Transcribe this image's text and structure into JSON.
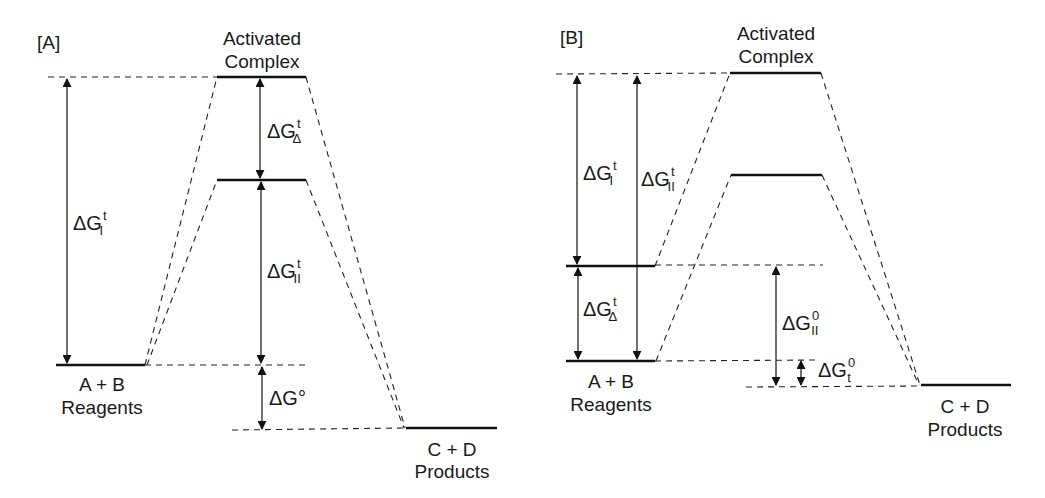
{
  "panels": [
    {
      "id": "A",
      "label": "[A]",
      "activated_complex": [
        "Activated",
        "Complex"
      ],
      "reagents": [
        "A + B",
        "Reagents"
      ],
      "products": [
        "C + D",
        "Products"
      ],
      "quantities": [
        {
          "base": "ΔG",
          "sup": "t",
          "sub": "I"
        },
        {
          "base": "ΔG",
          "sup": "t",
          "sub": "Δ"
        },
        {
          "base": "ΔG",
          "sup": "t",
          "sub": "II"
        },
        {
          "base": "ΔG°",
          "sup": "",
          "sub": ""
        }
      ]
    },
    {
      "id": "B",
      "label": "[B]",
      "activated_complex": [
        "Activated",
        "Complex"
      ],
      "reagents": [
        "A + B",
        "Reagents"
      ],
      "products": [
        "C + D",
        "Products"
      ],
      "quantities": [
        {
          "base": "ΔG",
          "sup": "t",
          "sub": "I"
        },
        {
          "base": "ΔG",
          "sup": "t",
          "sub": "II"
        },
        {
          "base": "ΔG",
          "sup": "t",
          "sub": "Δ"
        },
        {
          "base": "ΔG",
          "sup": "0",
          "sub": "II"
        },
        {
          "base": "ΔG",
          "sup": "0",
          "sub": "t"
        }
      ]
    }
  ],
  "colors": {
    "ink": "#111111",
    "background": "#ffffff"
  }
}
